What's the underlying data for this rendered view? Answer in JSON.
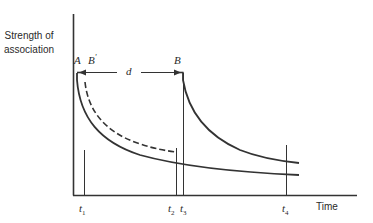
{
  "diagram": {
    "y_axis_label_line1": "Strength of",
    "y_axis_label_line2": "association",
    "x_axis_label": "Time",
    "point_labels": {
      "A": "A",
      "B_prime": "B",
      "B_prime_mark": "'",
      "B": "B",
      "d": "d"
    },
    "time_marks": [
      {
        "base": "t",
        "sub": "1"
      },
      {
        "base": "t",
        "sub": "2"
      },
      {
        "base": "t",
        "sub": "3"
      },
      {
        "base": "t",
        "sub": "4"
      }
    ],
    "colors": {
      "line": "#333333",
      "background": "#ffffff"
    }
  }
}
